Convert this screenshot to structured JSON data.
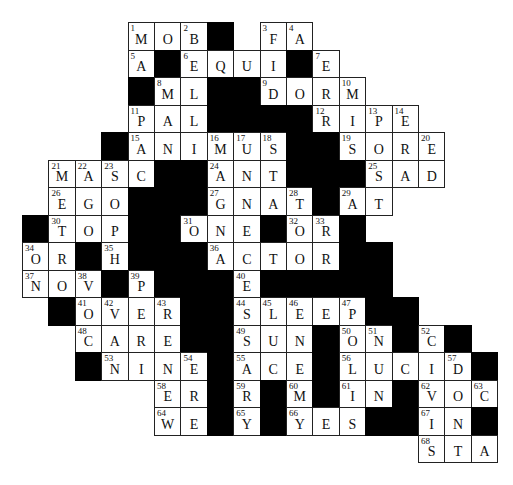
{
  "puzzle": {
    "type": "crossword",
    "rows": 16,
    "cols": 18,
    "grid": [
      "....MOB#.FA.......",
      "....A#EQUI#E......",
      "....#ML##DORM.....",
      "....PAL####RIPE...",
      "...#ANIMUS##SORE..",
      ".MASC##ANT###SAD..",
      ".EGO###GNAT#AT....",
      "#TOP##ONE#OR#.....",
      "OR#H###ACTOR##....",
      "NOV#P###E#####....",
      ".#OVER##SLEEP##...",
      "..CARE##SUN#ON#C#.",
      "..#NINE#ACE#LUCID#",
      ".....ER#R#M#IN#VOC",
      ".....WE#Y#YES##IN#",
      "...............STA"
    ],
    "legend": {
      ".": "outside",
      "#": "black-square"
    },
    "numbers": [
      [
        0,
        4,
        1
      ],
      [
        0,
        6,
        2
      ],
      [
        0,
        9,
        3
      ],
      [
        0,
        10,
        4
      ],
      [
        1,
        4,
        5
      ],
      [
        1,
        6,
        6
      ],
      [
        1,
        11,
        7
      ],
      [
        2,
        5,
        8
      ],
      [
        2,
        9,
        9
      ],
      [
        2,
        12,
        10
      ],
      [
        3,
        4,
        11
      ],
      [
        3,
        11,
        12
      ],
      [
        3,
        13,
        13
      ],
      [
        3,
        14,
        14
      ],
      [
        4,
        4,
        15
      ],
      [
        4,
        7,
        16
      ],
      [
        4,
        8,
        17
      ],
      [
        4,
        9,
        18
      ],
      [
        4,
        12,
        19
      ],
      [
        4,
        15,
        20
      ],
      [
        5,
        1,
        21
      ],
      [
        5,
        2,
        22
      ],
      [
        5,
        3,
        23
      ],
      [
        5,
        7,
        24
      ],
      [
        5,
        13,
        25
      ],
      [
        6,
        1,
        26
      ],
      [
        6,
        7,
        27
      ],
      [
        6,
        10,
        28
      ],
      [
        6,
        12,
        29
      ],
      [
        7,
        1,
        30
      ],
      [
        7,
        6,
        31
      ],
      [
        7,
        10,
        32
      ],
      [
        7,
        11,
        33
      ],
      [
        8,
        0,
        34
      ],
      [
        8,
        3,
        35
      ],
      [
        8,
        7,
        36
      ],
      [
        9,
        0,
        37
      ],
      [
        9,
        2,
        38
      ],
      [
        9,
        4,
        39
      ],
      [
        9,
        8,
        40
      ],
      [
        10,
        2,
        41
      ],
      [
        10,
        3,
        42
      ],
      [
        10,
        5,
        43
      ],
      [
        10,
        8,
        44
      ],
      [
        10,
        9,
        45
      ],
      [
        10,
        10,
        46
      ],
      [
        10,
        12,
        47
      ],
      [
        11,
        2,
        48
      ],
      [
        11,
        8,
        49
      ],
      [
        11,
        12,
        50
      ],
      [
        11,
        13,
        51
      ],
      [
        11,
        15,
        52
      ],
      [
        12,
        3,
        53
      ],
      [
        12,
        6,
        54
      ],
      [
        12,
        8,
        55
      ],
      [
        12,
        12,
        56
      ],
      [
        12,
        16,
        57
      ],
      [
        13,
        5,
        58
      ],
      [
        13,
        8,
        59
      ],
      [
        13,
        10,
        60
      ],
      [
        13,
        12,
        61
      ],
      [
        13,
        15,
        62
      ],
      [
        13,
        17,
        63
      ],
      [
        14,
        5,
        64
      ],
      [
        14,
        8,
        65
      ],
      [
        14,
        10,
        66
      ],
      [
        14,
        15,
        67
      ],
      [
        15,
        15,
        68
      ]
    ]
  }
}
